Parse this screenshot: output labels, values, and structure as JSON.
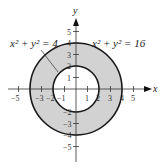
{
  "diagram": {
    "axes": {
      "x_label": "x",
      "y_label": "y"
    },
    "x_ticks": [
      "−5",
      "−3",
      "−2",
      "−1",
      "1",
      "2",
      "3",
      "4",
      "5"
    ],
    "y_ticks_pos": [
      "1",
      "2",
      "3",
      "4",
      "5"
    ],
    "y_ticks_neg": [
      "−2",
      "−3",
      "−4",
      "−5"
    ],
    "labels": {
      "inner": "x² + y² = 4",
      "outer": "x² + y² = 16"
    },
    "circles": [
      {
        "equation": "x^2 + y^2 = 4",
        "radius": 2
      },
      {
        "equation": "x^2 + y^2 = 16",
        "radius": 4
      }
    ],
    "shaded_region": "annulus between radius 2 and radius 4",
    "colors": {
      "shade": "#d2d2d2",
      "stroke": "#1a1a1a"
    }
  }
}
